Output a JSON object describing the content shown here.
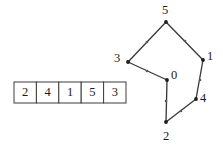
{
  "figure": {
    "background_color": "#ffffff",
    "line_color": "#3a3a3a",
    "text_color": "#1a1a1a",
    "width": 223,
    "height": 145
  },
  "array": {
    "name": "array-of-five-values",
    "cell_count": 5,
    "values": [
      "2",
      "4",
      "1",
      "5",
      "3"
    ],
    "geometry": {
      "x": 14,
      "y": 82,
      "cell_width": 22.4,
      "cell_height": 21
    }
  },
  "polygon": {
    "name": "labeled-vertex-polygon",
    "vertex_labels": [
      "0",
      "1",
      "2",
      "3",
      "4",
      "5"
    ],
    "vertices": [
      {
        "label": "0",
        "x": 167,
        "y": 80,
        "label_x": 171,
        "label_y": 79
      },
      {
        "label": "1",
        "x": 203,
        "y": 60,
        "label_x": 207,
        "label_y": 60
      },
      {
        "label": "2",
        "x": 166,
        "y": 122,
        "label_x": 163,
        "label_y": 140
      },
      {
        "label": "3",
        "x": 128,
        "y": 62,
        "label_x": 114,
        "label_y": 62
      },
      {
        "label": "4",
        "x": 196,
        "y": 99,
        "label_x": 200,
        "label_y": 102
      },
      {
        "label": "5",
        "x": 166,
        "y": 22,
        "label_x": 162,
        "label_y": 14
      }
    ],
    "edges": [
      {
        "from": "3",
        "to": "5"
      },
      {
        "from": "5",
        "to": "1"
      },
      {
        "from": "1",
        "to": "4"
      },
      {
        "from": "4",
        "to": "2"
      },
      {
        "from": "2",
        "to": "0"
      },
      {
        "from": "0",
        "to": "3"
      }
    ],
    "edge_midpoint_dots": [
      {
        "x": 147,
        "y": 42
      },
      {
        "x": 185,
        "y": 41
      },
      {
        "x": 200,
        "y": 80
      },
      {
        "x": 181,
        "y": 111
      },
      {
        "x": 166,
        "y": 101
      },
      {
        "x": 147,
        "y": 71
      }
    ],
    "vertex_dot_radius": 1.9,
    "mid_dot_radius": 1.3
  }
}
